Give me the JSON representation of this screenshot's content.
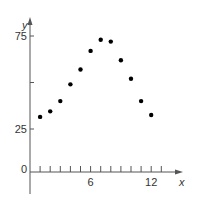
{
  "chart_data": {
    "type": "scatter",
    "title": "",
    "xlabel": "x",
    "ylabel": "y",
    "x_ticks": [
      1,
      2,
      3,
      4,
      5,
      6,
      7,
      8,
      9,
      10,
      11,
      12,
      13
    ],
    "x_tick_labels": [
      "6",
      "12"
    ],
    "y_tick_labels": [
      "0",
      "25",
      "75"
    ],
    "y_ticks": [
      25,
      50,
      75
    ],
    "xlim": [
      0,
      14
    ],
    "ylim": [
      0,
      80
    ],
    "grid": false,
    "x": [
      1,
      2,
      3,
      4,
      5,
      6,
      7,
      8,
      9,
      10,
      11,
      12
    ],
    "y": [
      31.5,
      34.5,
      40,
      49,
      57,
      67,
      73,
      72,
      62,
      52,
      40,
      32.5
    ],
    "point_color": "#000000"
  }
}
